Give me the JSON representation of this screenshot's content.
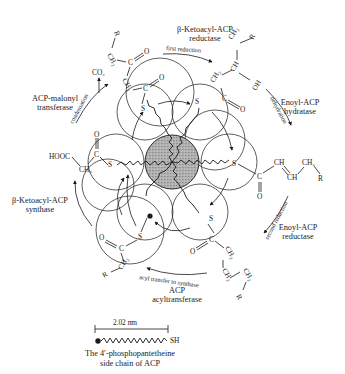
{
  "diagram": {
    "enzymes": [
      {
        "id": "kr",
        "line1": "β-Ketoacyl-ACP",
        "line2": "reductase"
      },
      {
        "id": "hd",
        "line1": "Enoyl-ACP",
        "line2": "hydratase"
      },
      {
        "id": "er",
        "line1": "Enoyl-ACP",
        "line2": "reductase"
      },
      {
        "id": "at",
        "line1": "ACP",
        "line2": "acyltransferase"
      },
      {
        "id": "ks",
        "line1": "β-Ketoacyl-ACP",
        "line2": "synthase"
      },
      {
        "id": "mt",
        "line1": "ACP-malonyl",
        "line2": "transferase"
      }
    ],
    "steps": {
      "first_reduction": "first reduction",
      "dehydration": "dehydration",
      "second_reduction": "second reduction",
      "acyl_transfer": "acyl transfer to synthase",
      "condensation": "condensation"
    },
    "chemistry": {
      "co2": "CO₂",
      "hooc": "HOOC",
      "ch3": "CH₃",
      "ch2": "CH₂",
      "ch": "CH",
      "c": "C",
      "o": "O",
      "s": "S",
      "oh": "OH",
      "r": "R",
      "sh": "SH"
    },
    "legend": {
      "scale": "2.02 nm",
      "caption_line1": "The 4′-phosphopantetheine",
      "caption_line2": "side chain of ACP"
    }
  }
}
